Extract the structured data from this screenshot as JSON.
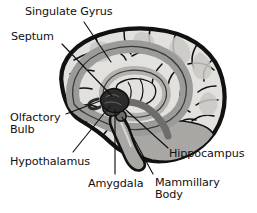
{
  "figure": {
    "view": "mid-sagittal (medial) section, left hemisphere, facing left",
    "background_color": "#ffffff",
    "outline_color": "#111111",
    "palette": {
      "cortex_fill": "#e2e1df",
      "cortex_shadow": "#c9c8c5",
      "gyrus_band": "#9b9b99",
      "inner_ring": "#b3b2af",
      "deep_structure": "#6e6d6b",
      "amygdala_dark": "#2b2b2b",
      "brainstem": "#a8a7a4",
      "leader_line": "#111111",
      "text": "#111111"
    }
  },
  "labels": [
    {
      "id": "singulate-gyrus",
      "text": "Singulate Gyrus",
      "lines": [
        "Singulate Gyrus"
      ],
      "structure": "cingulate gyrus",
      "text_anchor": {
        "x": 25,
        "y": 6
      },
      "leader": {
        "from": {
          "x": 84,
          "y": 22
        },
        "to": {
          "x": 111,
          "y": 62
        }
      }
    },
    {
      "id": "septum",
      "text": "Septum",
      "lines": [
        "Septum"
      ],
      "structure": "septum",
      "text_anchor": {
        "x": 11,
        "y": 31
      },
      "leader": {
        "from": {
          "x": 62,
          "y": 44
        },
        "to": {
          "x": 112,
          "y": 96
        }
      }
    },
    {
      "id": "olfactory-bulb",
      "text": "Olfactory Bulb",
      "lines": [
        "Olfactory",
        "Bulb"
      ],
      "structure": "olfactory bulb",
      "text_anchor": {
        "x": 10,
        "y": 112
      },
      "leader": {
        "from": {
          "x": 66,
          "y": 114
        },
        "to": {
          "x": 100,
          "y": 101
        }
      }
    },
    {
      "id": "hypothalamus",
      "text": "Hypothalamus",
      "lines": [
        "Hypothalamus"
      ],
      "structure": "hypothalamus",
      "text_anchor": {
        "x": 10,
        "y": 156
      },
      "leader": {
        "from": {
          "x": 73,
          "y": 152
        },
        "to": {
          "x": 110,
          "y": 106
        }
      }
    },
    {
      "id": "amygdala",
      "text": "Amygdala",
      "lines": [
        "Amygdala"
      ],
      "structure": "amygdala",
      "text_anchor": {
        "x": 88,
        "y": 178
      },
      "leader": {
        "from": {
          "x": 115,
          "y": 174
        },
        "to": {
          "x": 115,
          "y": 110
        }
      }
    },
    {
      "id": "hippocampus",
      "text": "Hippocampus",
      "lines": [
        "Hippocampus"
      ],
      "structure": "hippocampus",
      "text_anchor": {
        "x": 169,
        "y": 148
      },
      "leader": {
        "from": {
          "x": 168,
          "y": 148
        },
        "to": {
          "x": 126,
          "y": 110
        }
      }
    },
    {
      "id": "mammillary-body",
      "text": "Mammillary Body",
      "lines": [
        "Mammillary",
        "Body"
      ],
      "structure": "mammillary body",
      "text_anchor": {
        "x": 155,
        "y": 177
      },
      "leader": {
        "from": {
          "x": 153,
          "y": 174
        },
        "to": {
          "x": 122,
          "y": 117
        }
      }
    }
  ]
}
